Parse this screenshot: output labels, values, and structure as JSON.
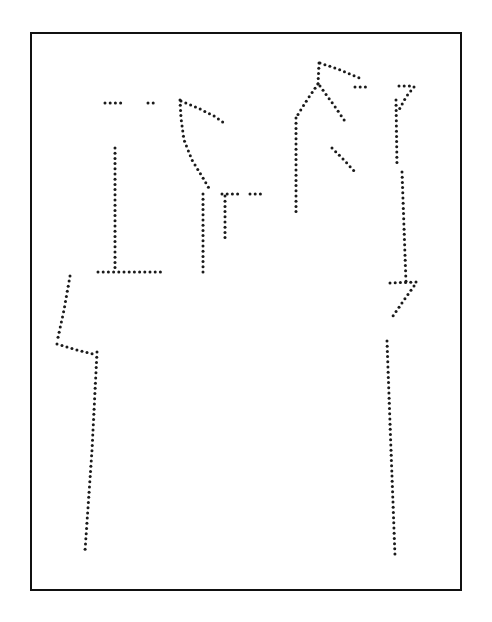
{
  "document": {
    "kind": "patent-style dotted line drawing",
    "background_color": "#ffffff",
    "canvas": {
      "width": 492,
      "height": 622
    }
  },
  "frame": {
    "name": "figure-border",
    "x": 30,
    "y": 32,
    "width": 432,
    "height": 559,
    "border_color": "#111111",
    "border_width": 2,
    "fill": "#ffffff"
  },
  "drawing": {
    "dot_color": "#1a1a1a",
    "dot_radius": 1.5,
    "dot_spacing": 5.2,
    "strokes": [
      {
        "name": "left-shoulder-dash-a",
        "closed": false,
        "points": [
          [
            105,
            103
          ],
          [
            121,
            103
          ]
        ]
      },
      {
        "name": "left-shoulder-dash-b",
        "closed": false,
        "points": [
          [
            148,
            103
          ],
          [
            158,
            103
          ]
        ]
      },
      {
        "name": "left-panel-vertical",
        "closed": false,
        "points": [
          [
            115,
            148
          ],
          [
            115,
            268
          ]
        ]
      },
      {
        "name": "left-panel-hem",
        "closed": false,
        "points": [
          [
            98,
            272
          ],
          [
            163,
            272
          ]
        ]
      },
      {
        "name": "center-left-collar-and-seam",
        "closed": false,
        "points": [
          [
            180,
            100
          ],
          [
            181,
            118
          ],
          [
            184,
            140
          ],
          [
            192,
            160
          ],
          [
            203,
            178
          ],
          [
            210,
            190
          ]
        ]
      },
      {
        "name": "center-left-shoulder-slope",
        "closed": false,
        "points": [
          [
            181,
            101
          ],
          [
            198,
            108
          ],
          [
            214,
            116
          ],
          [
            224,
            123
          ]
        ]
      },
      {
        "name": "center-inner-vertical",
        "closed": false,
        "points": [
          [
            203,
            194
          ],
          [
            203,
            272
          ]
        ]
      },
      {
        "name": "center-inner-short-vertical",
        "closed": false,
        "points": [
          [
            225,
            196
          ],
          [
            225,
            238
          ]
        ]
      },
      {
        "name": "center-dash-a",
        "closed": false,
        "points": [
          [
            222,
            194
          ],
          [
            238,
            194
          ]
        ]
      },
      {
        "name": "center-dash-b",
        "closed": false,
        "points": [
          [
            250,
            194
          ],
          [
            264,
            194
          ]
        ]
      },
      {
        "name": "right-peak-shoulder-slope",
        "closed": false,
        "points": [
          [
            320,
            63
          ],
          [
            338,
            69
          ],
          [
            352,
            75
          ],
          [
            362,
            79
          ]
        ]
      },
      {
        "name": "right-peak-dash",
        "closed": false,
        "points": [
          [
            355,
            87
          ],
          [
            370,
            87
          ]
        ]
      },
      {
        "name": "right-peak-left-leg",
        "closed": false,
        "points": [
          [
            319,
            63
          ],
          [
            318,
            84
          ]
        ]
      },
      {
        "name": "right-peak-v-left",
        "closed": false,
        "points": [
          [
            318,
            84
          ],
          [
            307,
            100
          ],
          [
            297,
            116
          ]
        ]
      },
      {
        "name": "right-peak-v-right",
        "closed": false,
        "points": [
          [
            320,
            86
          ],
          [
            333,
            104
          ],
          [
            347,
            124
          ]
        ]
      },
      {
        "name": "right-body-vertical",
        "closed": false,
        "points": [
          [
            296,
            118
          ],
          [
            296,
            216
          ]
        ]
      },
      {
        "name": "right-inner-diagonal",
        "closed": false,
        "points": [
          [
            332,
            148
          ],
          [
            344,
            160
          ],
          [
            356,
            173
          ]
        ]
      },
      {
        "name": "far-right-hook-top",
        "closed": false,
        "points": [
          [
            399,
            86
          ],
          [
            414,
            86
          ]
        ]
      },
      {
        "name": "far-right-hook-diagonal",
        "closed": false,
        "points": [
          [
            414,
            87
          ],
          [
            406,
            97
          ],
          [
            399,
            110
          ]
        ]
      },
      {
        "name": "far-right-upper-vertical",
        "closed": false,
        "points": [
          [
            396,
            100
          ],
          [
            397,
            166
          ]
        ]
      },
      {
        "name": "far-right-mid-vertical",
        "closed": false,
        "points": [
          [
            402,
            172
          ],
          [
            406,
            282
          ]
        ]
      },
      {
        "name": "far-right-crossbar",
        "closed": false,
        "points": [
          [
            390,
            283
          ],
          [
            416,
            282
          ]
        ]
      },
      {
        "name": "far-right-zigzag-diagonal",
        "closed": false,
        "points": [
          [
            414,
            286
          ],
          [
            404,
            300
          ],
          [
            393,
            316
          ]
        ]
      },
      {
        "name": "far-right-leg",
        "closed": false,
        "points": [
          [
            387,
            341
          ],
          [
            391,
            450
          ],
          [
            395,
            556
          ]
        ]
      },
      {
        "name": "left-outer-upper-diagonal",
        "closed": false,
        "points": [
          [
            70,
            276
          ],
          [
            64,
            310
          ],
          [
            57,
            342
          ]
        ]
      },
      {
        "name": "left-outer-lower-diagonal",
        "closed": false,
        "points": [
          [
            57,
            344
          ],
          [
            77,
            350
          ],
          [
            97,
            355
          ]
        ]
      },
      {
        "name": "left-leg",
        "closed": false,
        "points": [
          [
            97,
            352
          ],
          [
            92,
            450
          ],
          [
            85,
            551
          ]
        ]
      }
    ]
  }
}
